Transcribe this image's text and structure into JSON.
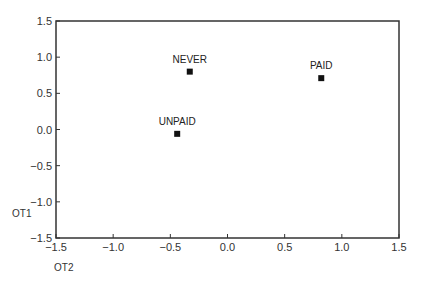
{
  "chart_data": {
    "type": "scatter",
    "title": "",
    "xlabel": "OT2",
    "ylabel": "OT1",
    "xlim": [
      -1.5,
      1.5
    ],
    "ylim": [
      -1.5,
      1.5
    ],
    "xticks": [
      -1.5,
      -1.0,
      -0.5,
      0.0,
      0.5,
      1.0,
      1.5
    ],
    "yticks": [
      -1.5,
      -1.0,
      -0.5,
      0.0,
      0.5,
      1.0,
      1.5
    ],
    "xtick_labels": [
      "−1.5",
      "−1.0",
      "−0.5",
      "0.0",
      "0.5",
      "1.0",
      "1.5"
    ],
    "ytick_labels": [
      "−1.5",
      "−1.0",
      "−0.5",
      "0.0",
      "0.5",
      "1.0",
      "1.5"
    ],
    "grid": false,
    "legend": null,
    "points": [
      {
        "label": "NEVER",
        "x": -0.33,
        "y": 0.8
      },
      {
        "label": "PAID",
        "x": 0.82,
        "y": 0.71
      },
      {
        "label": "UNPAID",
        "x": -0.44,
        "y": -0.06
      }
    ],
    "marker": "square",
    "marker_color": "#111111",
    "frame_color": "#333333"
  }
}
